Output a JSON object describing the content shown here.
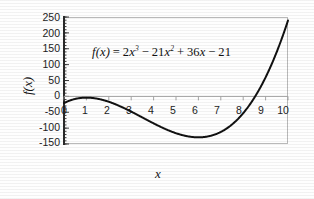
{
  "chart_data": {
    "type": "line",
    "title": "",
    "annotation": "f(x) = 2x³ − 21x² + 36x − 21",
    "equation": {
      "lhs": "f(x)",
      "equals": "=",
      "term1_coef": "2",
      "term1_var": "x",
      "term1_pow": "3",
      "op1": "−",
      "term2_coef": "21",
      "term2_var": "x",
      "term2_pow": "2",
      "op2": "+",
      "term3_coef": "36",
      "term3_var": "x",
      "op3": "−",
      "term4": "21"
    },
    "xlabel": "x",
    "ylabel": "f(x)",
    "xlim": [
      0,
      10
    ],
    "ylim": [
      -150,
      250
    ],
    "xticks": [
      "0",
      "1",
      "2",
      "3",
      "4",
      "5",
      "6",
      "7",
      "8",
      "9",
      "10"
    ],
    "yticks": [
      "250",
      "200",
      "150",
      "100",
      "50",
      "0",
      "-50",
      "-100",
      "-150"
    ],
    "grid": false,
    "legend": null,
    "series": [
      {
        "name": "f(x) = 2x^3 - 21x^2 + 36x - 21",
        "x": [
          0,
          0.25,
          0.5,
          0.75,
          1,
          1.25,
          1.5,
          1.75,
          2,
          2.25,
          2.5,
          2.75,
          3,
          3.25,
          3.5,
          3.75,
          4,
          4.25,
          4.5,
          4.75,
          5,
          5.25,
          5.5,
          5.75,
          6,
          6.25,
          6.5,
          6.75,
          7,
          7.25,
          7.5,
          7.75,
          8,
          8.25,
          8.5,
          8.75,
          9,
          9.25,
          9.5,
          9.75,
          10
        ],
        "values": [
          -21,
          -13.3,
          -7.8,
          -4.3,
          -4,
          -4.2,
          -6.8,
          -11.3,
          -17,
          -24.2,
          -32.3,
          -41.3,
          -51,
          -61.2,
          -71.8,
          -82.5,
          -93,
          -103.2,
          -112.9,
          -121.7,
          -129.5,
          -136.1,
          -141.3,
          -144.8,
          -147,
          -146.8,
          -144.5,
          -139.8,
          -133,
          -123.4,
          -111,
          -95.6,
          -77,
          -54.9,
          -29.3,
          0.1,
          33.3,
          70.9,
          113.1,
          160.2,
          212.4
        ],
        "color": "#111111",
        "style": "solid",
        "width": 2
      }
    ],
    "features": {
      "local_max": {
        "x": 1.1,
        "y": -4.0
      },
      "local_min": {
        "x": 6.0,
        "y": -147.0
      },
      "root": {
        "x": 8.75,
        "y": 0
      }
    },
    "zero_line": true,
    "minor_ticks_y": true
  },
  "figure": {
    "frame": "plot-border",
    "background": "#ffffff",
    "axis_color": "#2a2a2a",
    "frame_color": "#b9b9b9"
  }
}
